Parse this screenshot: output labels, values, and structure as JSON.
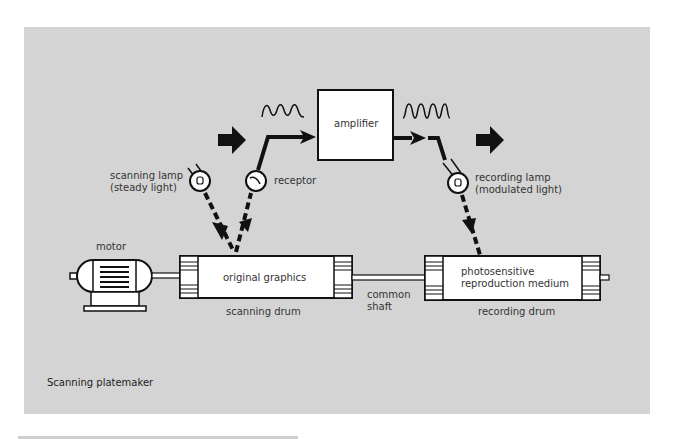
{
  "diagram": {
    "title": "Scanning platemaker",
    "colors": {
      "background": "#ffffff",
      "panel": "#d4d4d4",
      "ink": "#111111",
      "box_fill": "#ffffff"
    },
    "components": {
      "amplifier": "amplifier",
      "scanning_lamp": [
        "scanning lamp",
        "(steady light)"
      ],
      "receptor": "receptor",
      "recording_lamp": [
        "recording lamp",
        "(modulated light)"
      ],
      "motor": "motor",
      "original_graphics": "original graphics",
      "scanning_drum": "scanning drum",
      "common_shaft": [
        "common",
        "shaft"
      ],
      "reproduction_medium": [
        "photosensitive",
        "reproduction medium"
      ],
      "recording_drum": "recording drum"
    },
    "signals": {
      "input_wave": "sine-wave-icon",
      "output_wave": "square-wave-icon"
    },
    "flow_direction": [
      "arrow-right-icon",
      "arrow-right-icon"
    ]
  }
}
